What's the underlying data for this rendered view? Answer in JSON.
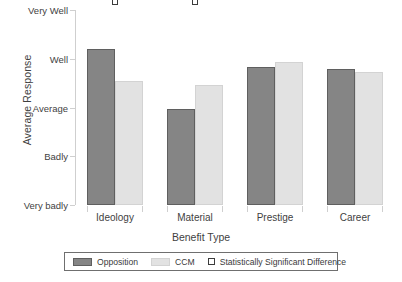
{
  "chart_data": {
    "type": "bar",
    "title": "",
    "xlabel": "Benefit Type",
    "ylabel": "Average Response",
    "categories": [
      "Ideology",
      "Material",
      "Prestige",
      "Career"
    ],
    "ytick_labels": [
      "Very badly",
      "Badly",
      "Average",
      "Well",
      "Very Well"
    ],
    "ytick_values": [
      1,
      2,
      3,
      4,
      5
    ],
    "ylim": [
      1,
      5
    ],
    "grid": false,
    "legend_position": "bottom",
    "series": [
      {
        "name": "Opposition",
        "color": "#858585",
        "values": [
          4.21,
          2.96,
          3.83,
          3.79
        ]
      },
      {
        "name": "CCM",
        "color": "#e2e2e2",
        "values": [
          3.54,
          3.46,
          3.94,
          3.73
        ]
      }
    ],
    "annotations": {
      "label": "Statistically Significant Difference",
      "marker": "open-square",
      "marker_value": 5,
      "categories": [
        "Ideology",
        "Material"
      ]
    }
  },
  "axes": {
    "y_title": "Average Response",
    "x_title": "Benefit Type",
    "y_ticks": [
      {
        "label": "Very Well",
        "value": 5
      },
      {
        "label": "Well",
        "value": 4
      },
      {
        "label": "Average",
        "value": 3
      },
      {
        "label": "Badly",
        "value": 2
      },
      {
        "label": "Very badly",
        "value": 1
      }
    ],
    "x_ticks": [
      "Ideology",
      "Material",
      "Prestige",
      "Career"
    ]
  },
  "legend": {
    "items": [
      {
        "label": "Opposition",
        "swatch": "filled-dark-gray-square"
      },
      {
        "label": "CCM",
        "swatch": "filled-light-gray-square"
      },
      {
        "label": "Statistically Significant Difference",
        "swatch": "open-square-marker"
      }
    ]
  },
  "colors": {
    "opposition": "#858585",
    "ccm": "#e2e2e2",
    "axis": "#cfcfcf",
    "text": "#3a3a3a",
    "marker_outline": "#3c3c3c"
  }
}
